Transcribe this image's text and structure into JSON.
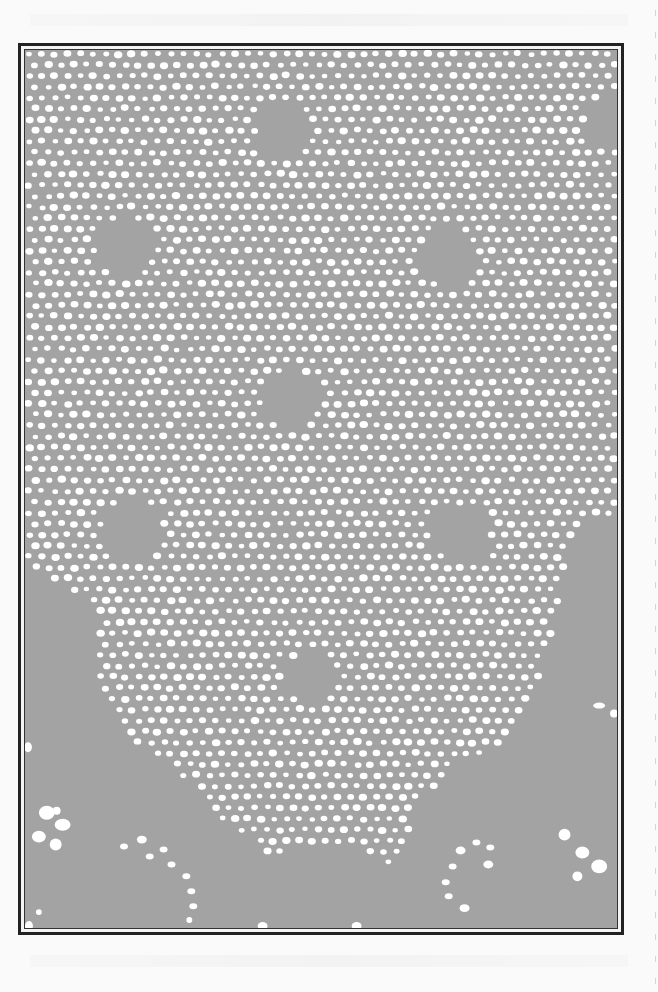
{
  "page": {
    "background": "#fafafa",
    "plate": {
      "frame": {
        "x": 18,
        "y": 43,
        "width": 606,
        "height": 892,
        "outer_color": "#222222",
        "inner_color": "#333333"
      },
      "fill": "#a3a3a3",
      "mesh_color": "#ffffff",
      "mesh": {
        "spacing_x": 13,
        "spacing_y": 11,
        "hole_rx": 3.6,
        "hole_ry": 3.0
      },
      "mesh_region_polygon": [
        [
          0,
          0
        ],
        [
          598,
          0
        ],
        [
          598,
          470
        ],
        [
          560,
          470
        ],
        [
          545,
          520
        ],
        [
          520,
          640
        ],
        [
          480,
          700
        ],
        [
          430,
          720
        ],
        [
          400,
          760
        ],
        [
          372,
          820
        ],
        [
          330,
          800
        ],
        [
          290,
          800
        ],
        [
          250,
          810
        ],
        [
          200,
          780
        ],
        [
          150,
          720
        ],
        [
          100,
          690
        ],
        [
          70,
          640
        ],
        [
          70,
          560
        ],
        [
          0,
          520
        ]
      ],
      "solid_motifs": [
        {
          "name": "motif-top-center",
          "cx": 260,
          "cy": 80,
          "r": 28
        },
        {
          "name": "motif-top-right",
          "cx": 590,
          "cy": 70,
          "r": 26
        },
        {
          "name": "motif-upper-left",
          "cx": 100,
          "cy": 198,
          "r": 30
        },
        {
          "name": "motif-upper-right",
          "cx": 428,
          "cy": 208,
          "r": 30
        },
        {
          "name": "motif-center",
          "cx": 268,
          "cy": 352,
          "r": 30
        },
        {
          "name": "motif-lower-left",
          "cx": 108,
          "cy": 482,
          "r": 32
        },
        {
          "name": "motif-lower-right",
          "cx": 440,
          "cy": 486,
          "r": 30
        },
        {
          "name": "motif-bottom-center",
          "cx": 286,
          "cy": 632,
          "r": 26
        }
      ],
      "scallop_holes": [
        {
          "cx": 22,
          "cy": 768,
          "rx": 8,
          "ry": 7
        },
        {
          "cx": 38,
          "cy": 780,
          "rx": 8,
          "ry": 6
        },
        {
          "cx": 14,
          "cy": 792,
          "rx": 7,
          "ry": 6
        },
        {
          "cx": 31,
          "cy": 800,
          "rx": 6,
          "ry": 6
        },
        {
          "cx": 32,
          "cy": 766,
          "rx": 4,
          "ry": 4
        },
        {
          "cx": 4,
          "cy": 882,
          "rx": 4,
          "ry": 5
        },
        {
          "cx": 14,
          "cy": 868,
          "rx": 3,
          "ry": 3
        },
        {
          "cx": 3,
          "cy": 702,
          "rx": 4,
          "ry": 5
        },
        {
          "cx": 100,
          "cy": 802,
          "rx": 4,
          "ry": 3
        },
        {
          "cx": 118,
          "cy": 795,
          "rx": 5,
          "ry": 4
        },
        {
          "cx": 140,
          "cy": 805,
          "rx": 4,
          "ry": 3
        },
        {
          "cx": 126,
          "cy": 812,
          "rx": 4,
          "ry": 3
        },
        {
          "cx": 148,
          "cy": 820,
          "rx": 4,
          "ry": 3
        },
        {
          "cx": 163,
          "cy": 832,
          "rx": 4,
          "ry": 3
        },
        {
          "cx": 168,
          "cy": 847,
          "rx": 4,
          "ry": 3
        },
        {
          "cx": 170,
          "cy": 862,
          "rx": 4,
          "ry": 3
        },
        {
          "cx": 166,
          "cy": 876,
          "rx": 3,
          "ry": 3
        },
        {
          "cx": 240,
          "cy": 882,
          "rx": 5,
          "ry": 4
        },
        {
          "cx": 232,
          "cy": 896,
          "rx": 8,
          "ry": 6
        },
        {
          "cx": 250,
          "cy": 902,
          "rx": 7,
          "ry": 6
        },
        {
          "cx": 270,
          "cy": 906,
          "rx": 7,
          "ry": 6
        },
        {
          "cx": 290,
          "cy": 907,
          "rx": 6,
          "ry": 5
        },
        {
          "cx": 310,
          "cy": 905,
          "rx": 8,
          "ry": 7
        },
        {
          "cx": 330,
          "cy": 900,
          "rx": 8,
          "ry": 6
        },
        {
          "cx": 345,
          "cy": 893,
          "rx": 6,
          "ry": 5
        },
        {
          "cx": 335,
          "cy": 882,
          "rx": 5,
          "ry": 4
        },
        {
          "cx": 440,
          "cy": 806,
          "rx": 5,
          "ry": 4
        },
        {
          "cx": 456,
          "cy": 798,
          "rx": 4,
          "ry": 3
        },
        {
          "cx": 470,
          "cy": 803,
          "rx": 4,
          "ry": 3
        },
        {
          "cx": 432,
          "cy": 822,
          "rx": 4,
          "ry": 3
        },
        {
          "cx": 425,
          "cy": 838,
          "rx": 4,
          "ry": 3
        },
        {
          "cx": 428,
          "cy": 852,
          "rx": 4,
          "ry": 3
        },
        {
          "cx": 444,
          "cy": 864,
          "rx": 5,
          "ry": 4
        },
        {
          "cx": 468,
          "cy": 820,
          "rx": 5,
          "ry": 4
        },
        {
          "cx": 545,
          "cy": 790,
          "rx": 6,
          "ry": 6
        },
        {
          "cx": 563,
          "cy": 808,
          "rx": 7,
          "ry": 6
        },
        {
          "cx": 580,
          "cy": 822,
          "rx": 8,
          "ry": 7
        },
        {
          "cx": 558,
          "cy": 832,
          "rx": 5,
          "ry": 5
        },
        {
          "cx": 580,
          "cy": 660,
          "rx": 6,
          "ry": 3
        },
        {
          "cx": 595,
          "cy": 668,
          "rx": 4,
          "ry": 4
        },
        {
          "cx": 590,
          "cy": 900,
          "rx": 3,
          "ry": 4
        },
        {
          "cx": 428,
          "cy": 905,
          "rx": 4,
          "ry": 4
        }
      ],
      "dark_stroke": "#222222"
    }
  }
}
